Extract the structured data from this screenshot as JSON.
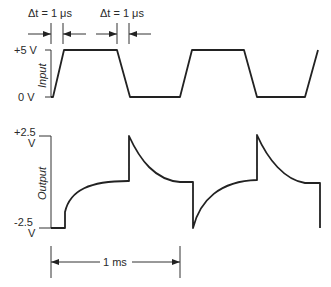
{
  "diagram": {
    "title": "",
    "annotations": {
      "rise_time": "Δt = 1 μs",
      "fall_time": "Δt = 1 μs",
      "period": "1 ms"
    },
    "input_axis": {
      "label": "Input",
      "top_tick": "+5 V",
      "bottom_tick": "0 V"
    },
    "output_axis": {
      "label": "Output",
      "top_tick_line1": "+2.5",
      "top_tick_line2": "V",
      "bottom_tick_line1": "-2.5",
      "bottom_tick_line2": "V"
    },
    "colors": {
      "stroke": "#222222",
      "background": "#ffffff"
    }
  }
}
